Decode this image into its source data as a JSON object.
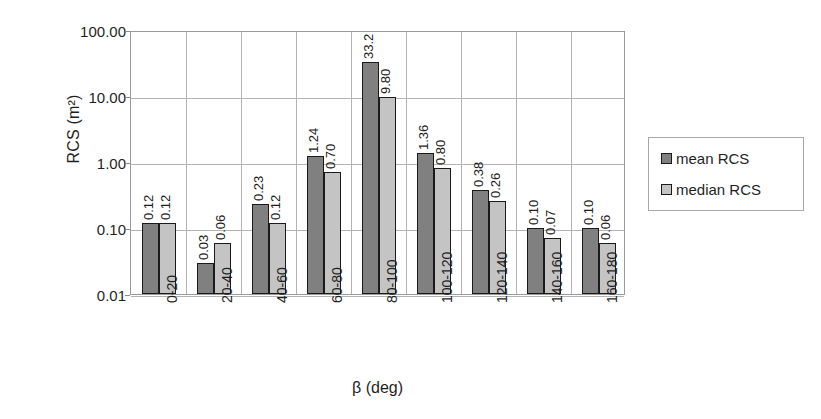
{
  "chart_data": {
    "type": "bar",
    "title": "",
    "subtitle": "",
    "xlabel": "β (deg)",
    "ylabel": "RCS (m²)",
    "yscale": "log",
    "ylim": [
      0.01,
      100.0
    ],
    "ytick_labels": [
      "100.00",
      "10.00",
      "1.00",
      "0.10",
      "0.01"
    ],
    "ytick_values": [
      100.0,
      10.0,
      1.0,
      0.1,
      0.01
    ],
    "grid": "horizontal-and-vertical",
    "legend_position": "right",
    "categories": [
      "0-20",
      "20-40",
      "40-60",
      "60-80",
      "80-100",
      "100-120",
      "120-140",
      "140-160",
      "160-180"
    ],
    "series": [
      {
        "name": "mean RCS",
        "color": "#808080",
        "values": [
          0.12,
          0.03,
          0.23,
          1.24,
          33.2,
          1.36,
          0.38,
          0.1,
          0.1
        ],
        "labels": [
          "0.12",
          "0.03",
          "0.23",
          "1.24",
          "33.2",
          "1.36",
          "0.38",
          "0.10",
          "0.10"
        ],
        "bar_heights_px": [
          66,
          103,
          48,
          5,
          24,
          2,
          35,
          70,
          70
        ]
      },
      {
        "name": "median RCS",
        "color": "#c4c4c4",
        "values": [
          0.12,
          0.06,
          0.12,
          0.7,
          9.8,
          0.8,
          0.26,
          0.07,
          0.06
        ],
        "labels": [
          "0.12",
          "0.06",
          "0.12",
          "0.70",
          "9.80",
          "0.80",
          "0.26",
          "0.07",
          "0.06"
        ],
        "bar_heights_px": [
          66,
          46,
          66,
          14,
          4,
          10,
          50,
          78,
          80
        ]
      }
    ]
  },
  "legend": {
    "entries": [
      {
        "label": "mean RCS",
        "color": "#808080"
      },
      {
        "label": "median RCS",
        "color": "#c4c4c4"
      }
    ]
  },
  "axes": {
    "y_title": "RCS (m²)",
    "x_title": "β (deg)"
  }
}
